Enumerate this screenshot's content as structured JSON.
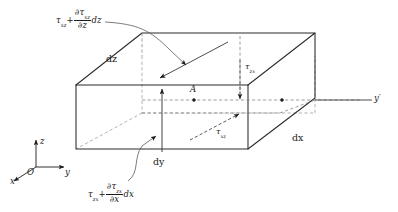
{
  "figure": {
    "kind": "stress-element-diagram",
    "colors": {
      "ink": "#1a1a1a",
      "solid_edge": "#2b2b2b",
      "hidden_edge": "#8a8a8a",
      "leader": "#4a4a4a",
      "background": "#ffffff"
    }
  },
  "axes": {
    "origin_label": "O",
    "z_label": "z",
    "y_label": "y",
    "x_label": "x",
    "y_prime_label": "y′"
  },
  "dimensions": [
    {
      "name": "dz",
      "label": "dz"
    },
    {
      "name": "dx",
      "label": "dx"
    },
    {
      "name": "dy",
      "label": "dy"
    }
  ],
  "point": {
    "name": "A",
    "label": "A"
  },
  "stresses": {
    "tau_zx": {
      "symbol": "τ",
      "subscript": "zx",
      "label": "τzx"
    },
    "tau_xz": {
      "symbol": "τ",
      "subscript": "xz",
      "label": "τxz"
    }
  },
  "formulas": {
    "top": {
      "base_symbol": "τ",
      "base_subscript": "xz",
      "plus": "+",
      "numerator_symbol": "∂τ",
      "numerator_subscript": "xz",
      "denominator": "∂z",
      "differential": "dz",
      "plain": "τxz + ∂τxz/∂z dz"
    },
    "bottom": {
      "base_symbol": "τ",
      "base_subscript": "zx",
      "plus": "+",
      "numerator_symbol": "∂τ",
      "numerator_subscript": "zx",
      "denominator": "∂x",
      "differential": "dx",
      "plain": "τzx + ∂τzx/∂x dx"
    }
  }
}
